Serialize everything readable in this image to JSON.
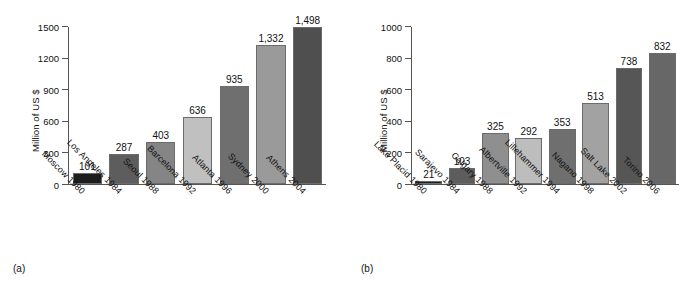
{
  "figure": {
    "background": "#ffffff"
  },
  "chart_data": [
    {
      "type": "bar",
      "panel": "(a)",
      "title": "",
      "xlabel": "",
      "ylabel": "Million of US $",
      "ylim": [
        0,
        1500
      ],
      "yticks": [
        0,
        300,
        600,
        900,
        1200,
        1500
      ],
      "ytick_labels": [
        "0",
        "300",
        "600",
        "900",
        "1200",
        "1500"
      ],
      "grid": false,
      "legend": "none",
      "categories": [
        "Moscow 1980",
        "Los Angeles 1984",
        "Seoul 1988",
        "Barcelona 1992",
        "Atlanta 1996",
        "Sydney 2000",
        "Athens 2004"
      ],
      "values": [
        101,
        287,
        403,
        636,
        935,
        1332,
        1498
      ],
      "value_labels": [
        "101",
        "287",
        "403",
        "636",
        "935",
        "1,332",
        "1,498"
      ],
      "bar_colors": [
        "#1d1d1d",
        "#5d5d5d",
        "#858585",
        "#c0c0c0",
        "#6f6f6f",
        "#9a9a9a",
        "#4f4f4f"
      ]
    },
    {
      "type": "bar",
      "panel": "(b)",
      "title": "",
      "xlabel": "",
      "ylabel": "Million of US $",
      "ylim": [
        0,
        1000
      ],
      "yticks": [
        0,
        200,
        400,
        600,
        800,
        1000
      ],
      "ytick_labels": [
        "0",
        "200",
        "400",
        "600",
        "800",
        "1000"
      ],
      "grid": false,
      "legend": "none",
      "categories": [
        "Lake Placid 1980",
        "Sarajevo 1984",
        "Calgary 1988",
        "Albertville 1992",
        "Lillehammer 1994",
        "Nagano 1998",
        "Salt Lake 2002",
        "Torino 2006"
      ],
      "values": [
        21,
        103,
        325,
        292,
        353,
        513,
        738,
        832
      ],
      "value_labels": [
        "21",
        "103",
        "325",
        "292",
        "353",
        "513",
        "738",
        "832"
      ],
      "bar_colors": [
        "#1d1d1d",
        "#5d5d5d",
        "#8f8f8f",
        "#bdbdbd",
        "#6f6f6f",
        "#a2a2a2",
        "#565656",
        "#676767"
      ]
    }
  ],
  "panels": {
    "a": {
      "caption": "(a)"
    },
    "b": {
      "caption": "(b)"
    }
  }
}
